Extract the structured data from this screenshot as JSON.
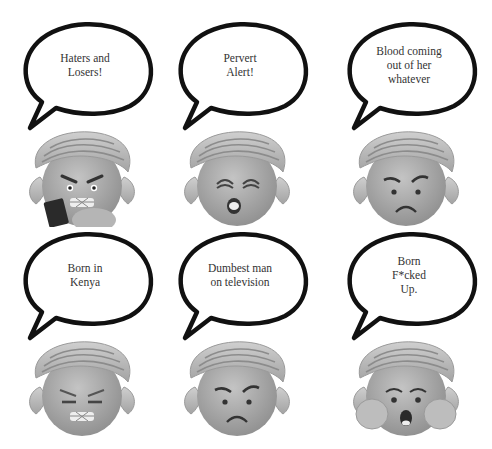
{
  "panels": [
    {
      "quote_lines": [
        "Haters and",
        "Losers!"
      ],
      "expression": "angry-gritted-teeth-holding-phone"
    },
    {
      "quote_lines": [
        "Pervert",
        "Alert!"
      ],
      "expression": "squinting-surprised"
    },
    {
      "quote_lines": [
        "Blood coming",
        "out of her",
        "whatever"
      ],
      "expression": "angry-frown"
    },
    {
      "quote_lines": [
        "Born in",
        "Kenya"
      ],
      "expression": "squinting-gritted-teeth"
    },
    {
      "quote_lines": [
        "Dumbest man",
        "on television"
      ],
      "expression": "angry-frown"
    },
    {
      "quote_lines": [
        "Born",
        "F*cked",
        "Up."
      ],
      "expression": "shocked-hands-on-cheeks"
    }
  ],
  "colors": {
    "bubble_outline": "#111111",
    "skin": "#a9a9a9",
    "hair": "#b9b9b9",
    "text": "#333333"
  }
}
